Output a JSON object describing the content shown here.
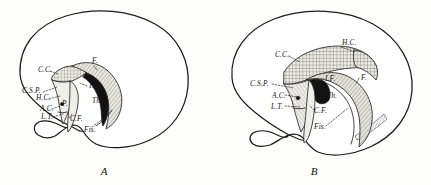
{
  "plate": {
    "title": "Comparative midsagittal brain diagrams",
    "background_color": "#fdfdfb",
    "ink_color": "#1b1b1b"
  },
  "figures": [
    {
      "id": "A",
      "caption": "A",
      "description": "Midsagittal view of a lower mammalian brain with small corpus callosum",
      "labels": [
        {
          "key": "cc",
          "text": "C.C.",
          "x": 38,
          "y": 72,
          "meaning": "corpus-callosum"
        },
        {
          "key": "f",
          "text": "F.",
          "x": 92,
          "y": 63,
          "meaning": "fornix"
        },
        {
          "key": "if",
          "text": "I.F.",
          "x": 89,
          "y": 88,
          "meaning": "interventricular-foramen"
        },
        {
          "key": "th",
          "text": "Th.",
          "x": 92,
          "y": 103,
          "meaning": "thalamus"
        },
        {
          "key": "csp",
          "text": "C.S.P.",
          "x": 26,
          "y": 93,
          "meaning": "cavum-septi-pellucidi"
        },
        {
          "key": "hc",
          "text": "H.C.",
          "x": 38,
          "y": 100,
          "meaning": "hippocampal-commissure"
        },
        {
          "key": "ac",
          "text": "A.C.",
          "x": 41,
          "y": 111,
          "meaning": "anterior-commissure"
        },
        {
          "key": "lt",
          "text": "L.T.",
          "x": 42,
          "y": 119,
          "meaning": "lamina-terminalis"
        },
        {
          "key": "cf",
          "text": "C.F.",
          "x": 70,
          "y": 120,
          "meaning": "columns-of-fornix"
        },
        {
          "key": "fis",
          "text": "Fis.",
          "x": 86,
          "y": 130,
          "meaning": "fissure"
        },
        {
          "key": "p",
          "text": "P.",
          "x": 64,
          "y": 104,
          "meaning": "pillar"
        }
      ]
    },
    {
      "id": "B",
      "caption": "B",
      "description": "Midsagittal view of a higher mammalian brain with large corpus callosum",
      "labels": [
        {
          "key": "hc",
          "text": "H.C.",
          "x": 130,
          "y": 45,
          "meaning": "hippocampal-commissure"
        },
        {
          "key": "cc",
          "text": "C.C.",
          "x": 63,
          "y": 57,
          "meaning": "corpus-callosum"
        },
        {
          "key": "csp",
          "text": "C.S.P.",
          "x": 40,
          "y": 86,
          "meaning": "cavum-septi-pellucidi"
        },
        {
          "key": "if",
          "text": "I.F.",
          "x": 111,
          "y": 80,
          "meaning": "interventricular-foramen"
        },
        {
          "key": "f",
          "text": "F.",
          "x": 146,
          "y": 80,
          "meaning": "fornix"
        },
        {
          "key": "ac",
          "text": "A.C.",
          "x": 60,
          "y": 97,
          "meaning": "anterior-commissure"
        },
        {
          "key": "th",
          "text": "Th.",
          "x": 114,
          "y": 97,
          "meaning": "thalamus"
        },
        {
          "key": "lt",
          "text": "L.T.",
          "x": 60,
          "y": 108,
          "meaning": "lamina-terminalis"
        },
        {
          "key": "cf",
          "text": "C.F.",
          "x": 99,
          "y": 112,
          "meaning": "columns-of-fornix"
        },
        {
          "key": "fis",
          "text": "Fis.",
          "x": 102,
          "y": 128,
          "meaning": "fissure"
        }
      ]
    }
  ],
  "legend_key": {
    "CC": "Corpus callosum",
    "HC": "Hippocampal commissure",
    "CSP": "Cavum septi pellucidi",
    "AC": "Anterior commissure",
    "LT": "Lamina terminalis",
    "CF": "Columns of fornix",
    "F": "Fornix",
    "IF": "Interventricular foramen",
    "Th": "Thalamus",
    "Fis": "Fissure"
  }
}
